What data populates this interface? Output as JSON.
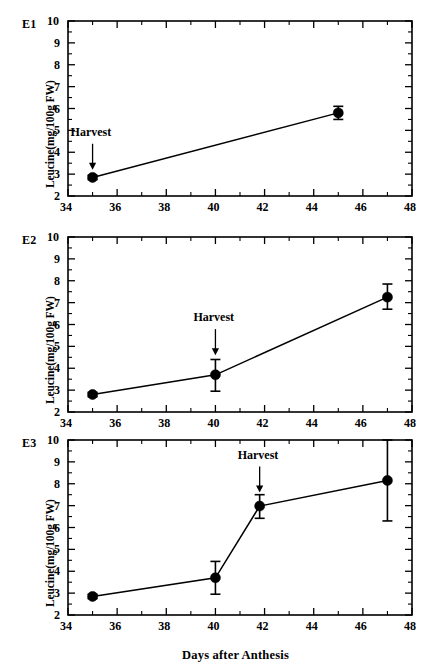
{
  "figure": {
    "xlabel": "Days after Anthesis",
    "ylabel": "Leucine(mg/100g FW)",
    "annotation_label": "Harvest"
  },
  "panels": [
    {
      "label": "E1"
    },
    {
      "label": "E2"
    },
    {
      "label": "E3"
    }
  ],
  "axis": {
    "x_ticks": [
      "34",
      "36",
      "38",
      "40",
      "42",
      "44",
      "46",
      "48"
    ],
    "y_ticks": [
      "2",
      "3",
      "4",
      "5",
      "6",
      "7",
      "8",
      "9",
      "10"
    ]
  },
  "chart_data": [
    {
      "type": "line",
      "title": "E1",
      "xlabel": "Days after Anthesis",
      "ylabel": "Leucine(mg/100g FW)",
      "xlim": [
        34,
        48
      ],
      "ylim": [
        2,
        10
      ],
      "xticks": [
        34,
        36,
        38,
        40,
        42,
        44,
        46,
        48
      ],
      "yticks": [
        2,
        3,
        4,
        5,
        6,
        7,
        8,
        9,
        10
      ],
      "grid": false,
      "legend": "none",
      "x": [
        35,
        45
      ],
      "values": [
        2.85,
        5.8
      ],
      "error_low": [
        2.75,
        5.5
      ],
      "error_high": [
        2.95,
        6.1
      ],
      "annotations": [
        {
          "text": "Harvest",
          "x": 35,
          "points_to_y": 3.2
        }
      ]
    },
    {
      "type": "line",
      "title": "E2",
      "xlabel": "Days after Anthesis",
      "ylabel": "Leucine(mg/100g FW)",
      "xlim": [
        34,
        48
      ],
      "ylim": [
        2,
        10
      ],
      "xticks": [
        34,
        36,
        38,
        40,
        42,
        44,
        46,
        48
      ],
      "yticks": [
        2,
        3,
        4,
        5,
        6,
        7,
        8,
        9,
        10
      ],
      "grid": false,
      "legend": "none",
      "x": [
        35,
        40,
        47
      ],
      "values": [
        2.8,
        3.7,
        7.25
      ],
      "error_low": [
        2.7,
        2.95,
        6.7
      ],
      "error_high": [
        2.9,
        4.4,
        7.85
      ],
      "annotations": [
        {
          "text": "Harvest",
          "x": 40,
          "points_to_y": 4.6
        }
      ]
    },
    {
      "type": "line",
      "title": "E3",
      "xlabel": "Days after Anthesis",
      "ylabel": "Leucine(mg/100g FW)",
      "xlim": [
        34,
        48
      ],
      "ylim": [
        2,
        10
      ],
      "xticks": [
        34,
        36,
        38,
        40,
        42,
        44,
        46,
        48
      ],
      "yticks": [
        2,
        3,
        4,
        5,
        6,
        7,
        8,
        9,
        10
      ],
      "grid": false,
      "legend": "none",
      "x": [
        35,
        40,
        41.8,
        47
      ],
      "values": [
        2.85,
        3.7,
        6.98,
        8.15
      ],
      "error_low": [
        2.75,
        2.95,
        6.42,
        6.3
      ],
      "error_high": [
        2.95,
        4.45,
        7.5,
        10.0
      ],
      "annotations": [
        {
          "text": "Harvest",
          "x": 41.8,
          "points_to_y": 7.6
        }
      ]
    }
  ]
}
